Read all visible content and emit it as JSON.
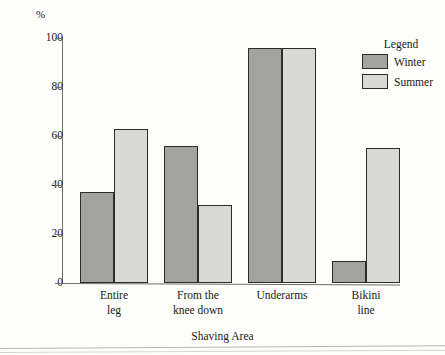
{
  "chart_data": {
    "type": "bar",
    "title": "",
    "xlabel": "Shaving Area",
    "ylabel": "%",
    "ylim": [
      0,
      100
    ],
    "yticks": [
      0,
      20,
      40,
      60,
      80,
      100
    ],
    "grid": false,
    "legend_position": "right",
    "legend_title": "Legend",
    "categories": [
      "Entire\nleg",
      "From the\nknee down",
      "Underarms",
      "Bikini\nline"
    ],
    "category_lines": [
      [
        "Entire",
        "leg"
      ],
      [
        "From the",
        "knee down"
      ],
      [
        "Underarms",
        ""
      ],
      [
        "Bikini",
        "line"
      ]
    ],
    "series": [
      {
        "name": "Winter",
        "color": "#a3a39f",
        "values": [
          37,
          56,
          96,
          9
        ]
      },
      {
        "name": "Summer",
        "color": "#d9d9d5",
        "values": [
          63,
          32,
          96,
          55
        ]
      }
    ]
  },
  "axes": {
    "y_unit_label": "%",
    "tick_labels": [
      "100",
      "80",
      "60",
      "40",
      "20",
      "0"
    ],
    "x_axis_title": "Shaving Area"
  },
  "legend": {
    "title": "Legend",
    "entries": [
      {
        "label": "Winter",
        "color": "#a3a39f"
      },
      {
        "label": "Summer",
        "color": "#d9d9d5"
      }
    ]
  }
}
